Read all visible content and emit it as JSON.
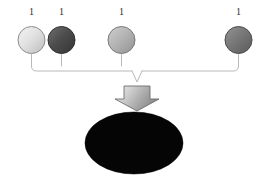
{
  "diagram": {
    "type": "convergence-diagram",
    "background_color": "#ffffff",
    "nodes": [
      {
        "id": "node-1",
        "label": "1",
        "shape": "sphere",
        "cx": 31.5,
        "cy": 40,
        "r": 13.5,
        "fill_light": "#f0f0f0",
        "fill_mid": "#d2d2d2",
        "fill_dark": "#b4b4b4",
        "stroke": "#8c8c8c",
        "label_x": 31.5,
        "label_y": 12
      },
      {
        "id": "node-2",
        "label": "1",
        "shape": "sphere",
        "cx": 61.5,
        "cy": 40,
        "r": 13.5,
        "fill_light": "#6b6b6b",
        "fill_mid": "#4f4f4f",
        "fill_dark": "#3a3a3a",
        "stroke": "#2e2e2e",
        "label_x": 61.5,
        "label_y": 12
      },
      {
        "id": "node-3",
        "label": "1",
        "shape": "sphere",
        "cx": 121.5,
        "cy": 40,
        "r": 13.5,
        "fill_light": "#c8c8c8",
        "fill_mid": "#ababab",
        "fill_dark": "#949494",
        "stroke": "#7a7a7a",
        "label_x": 121.5,
        "label_y": 12
      },
      {
        "id": "node-4",
        "label": "1",
        "shape": "sphere",
        "cx": 238.5,
        "cy": 40,
        "r": 13.5,
        "fill_light": "#8f8f8f",
        "fill_mid": "#747474",
        "fill_dark": "#5e5e5e",
        "stroke": "#4b4b4b",
        "label_x": 238.5,
        "label_y": 12
      }
    ],
    "connector": {
      "name": "brace-connector",
      "stroke": "#b9b9b9",
      "stroke_width": 1,
      "stub_top_y": 54,
      "rail_y": 71,
      "junction_x": 137,
      "junction_y": 82,
      "corner_radius": 5,
      "left_x": 31.5,
      "right_x": 238.5
    },
    "arrow": {
      "name": "down-arrow",
      "tip_x": 137,
      "top_y": 86,
      "bottom_y": 110,
      "shaft_half_width": 13,
      "head_half_width": 22,
      "shoulder_y": 99,
      "fill_light": "#e6e6e6",
      "fill_mid": "#bdbdbd",
      "fill_dark": "#8a8a8a",
      "stroke": "#6d6d6d"
    },
    "result": {
      "name": "result-ellipse",
      "cx": 134,
      "cy": 143,
      "rx": 49,
      "ry": 31,
      "fill": "#050505",
      "stroke": "#000000",
      "label": ""
    }
  }
}
